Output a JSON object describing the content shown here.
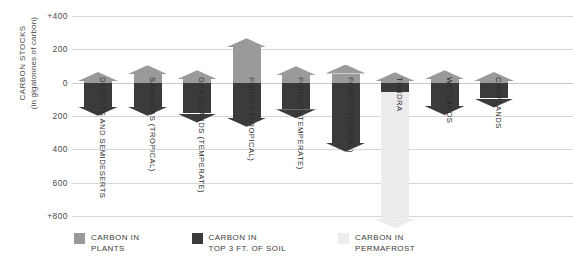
{
  "chart_data": {
    "type": "bar",
    "title": "",
    "ylabel": "CARBON STOCKS (in gigatonnes of carbon)",
    "xlabel": "",
    "orientation": "vertical",
    "note": "Values above the zero line are carbon in plants (above ground); values below the zero line are carbon in soil / permafrost (below ground). Axis is inverted below zero (positive downward).",
    "grid": true,
    "legend_position": "bottom-left",
    "ylim": [
      -400,
      800
    ],
    "yticks": [
      -400,
      -200,
      0,
      200,
      400,
      600,
      800
    ],
    "ytick_labels": [
      "+400",
      "200",
      "0",
      "200",
      "400",
      "600",
      "+800"
    ],
    "categories": [
      "DESERTS AND SEMIDESERTS",
      "SAVANNAS (TROPICAL)",
      "GRASSLANDS (TEMPERATE)",
      "FOREST (TROPICAL)",
      "FOREST (TEMPERATE)",
      "FOREST (BOREAL)",
      "TUNDRA",
      "WETLANDS",
      "CROPLANDS"
    ],
    "series": [
      {
        "name": "CARBON IN PLANTS",
        "color": "#9a9a9a",
        "values": [
          10,
          50,
          20,
          212,
          45,
          55,
          8,
          20,
          10
        ]
      },
      {
        "name": "CARBON IN TOP 3 FT. OF SOIL",
        "color": "#3b3b3b",
        "values": [
          145,
          145,
          185,
          210,
          160,
          360,
          55,
          140,
          95
        ]
      },
      {
        "name": "CARBON IN PERMAFROST",
        "color": "#ececec",
        "values": [
          0,
          0,
          0,
          0,
          0,
          0,
          820,
          0,
          0
        ]
      }
    ]
  },
  "legend": {
    "items": [
      {
        "label_line1": "CARBON IN",
        "label_line2": "PLANTS",
        "color": "#9a9a9a",
        "icon": "legend-swatch-plants"
      },
      {
        "label_line1": "CARBON IN",
        "label_line2": "TOP 3 FT. OF SOIL",
        "color": "#3b3b3b",
        "icon": "legend-swatch-soil"
      },
      {
        "label_line1": "CARBON IN",
        "label_line2": "PERMAFROST",
        "color": "#ececec",
        "icon": "legend-swatch-permafrost"
      }
    ]
  },
  "axis": {
    "title_line1": "CARBON STOCKS",
    "title_line2": "(in gigatonnes of carbon)"
  }
}
